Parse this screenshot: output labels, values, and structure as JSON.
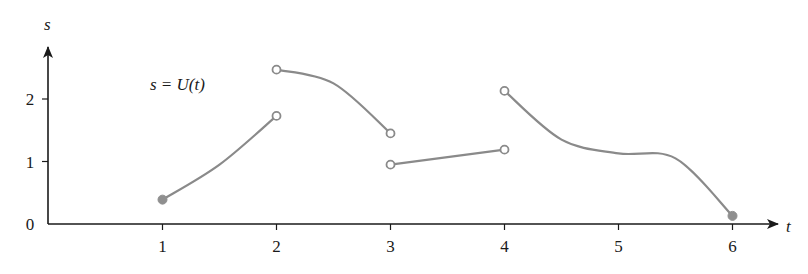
{
  "chart_data": {
    "type": "line",
    "title": "",
    "annotation": "s = U(t)",
    "xlabel": "t",
    "ylabel": "s",
    "xticks": [
      "1",
      "2",
      "3",
      "4",
      "5",
      "6"
    ],
    "yticks": [
      "0",
      "1",
      "2"
    ],
    "xlim": [
      0,
      6.4
    ],
    "ylim": [
      0,
      2.8
    ],
    "grid": false,
    "legend": null,
    "colors": {
      "axis": "#1a1a1a",
      "curve": "#8a8a8a"
    },
    "series": [
      {
        "name": "segment-1",
        "interval": [
          1,
          2
        ],
        "points": [
          [
            1,
            0.39
          ],
          [
            1.5,
            0.95
          ],
          [
            2,
            1.73
          ]
        ],
        "start": {
          "t": 1,
          "s": 0.39,
          "marker": "filled"
        },
        "end": {
          "t": 2,
          "s": 1.73,
          "marker": "open"
        }
      },
      {
        "name": "segment-2",
        "interval": [
          2,
          3
        ],
        "points": [
          [
            2,
            2.47
          ],
          [
            2.5,
            2.25
          ],
          [
            3,
            1.45
          ]
        ],
        "start": {
          "t": 2,
          "s": 2.47,
          "marker": "open"
        },
        "end": {
          "t": 3,
          "s": 1.45,
          "marker": "open"
        }
      },
      {
        "name": "segment-3",
        "interval": [
          3,
          4
        ],
        "points": [
          [
            3,
            0.95
          ],
          [
            4,
            1.19
          ]
        ],
        "start": {
          "t": 3,
          "s": 0.95,
          "marker": "open"
        },
        "end": {
          "t": 4,
          "s": 1.19,
          "marker": "open"
        }
      },
      {
        "name": "segment-4",
        "interval": [
          4,
          6
        ],
        "points": [
          [
            4,
            2.13
          ],
          [
            4.5,
            1.35
          ],
          [
            5,
            1.13
          ],
          [
            5.5,
            1.05
          ],
          [
            6,
            0.13
          ]
        ],
        "start": {
          "t": 4,
          "s": 2.13,
          "marker": "open"
        },
        "end": {
          "t": 6,
          "s": 0.13,
          "marker": "filled"
        }
      }
    ]
  }
}
